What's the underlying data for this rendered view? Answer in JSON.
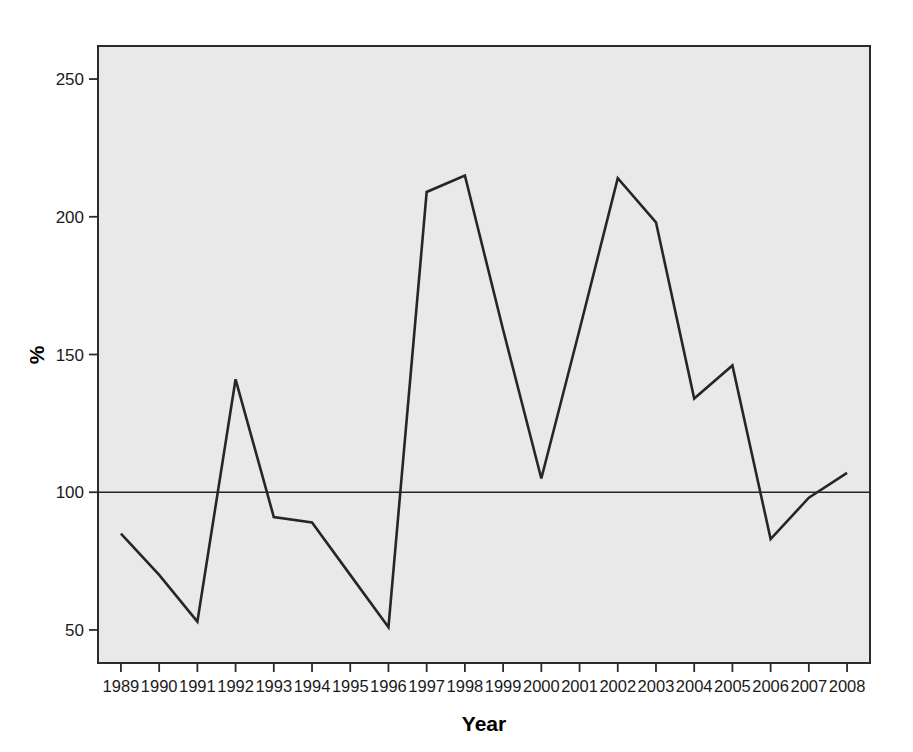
{
  "chart_data": {
    "type": "line",
    "title": "",
    "xlabel": "Year",
    "ylabel": "%",
    "x": [
      1989,
      1990,
      1991,
      1992,
      1993,
      1994,
      1995,
      1996,
      1997,
      1998,
      1999,
      2000,
      2001,
      2002,
      2003,
      2004,
      2005,
      2006,
      2007,
      2008
    ],
    "categories": [
      "1989",
      "1990",
      "1991",
      "1992",
      "1993",
      "1994",
      "1995",
      "1996",
      "1997",
      "1998",
      "1999",
      "2000",
      "2001",
      "2002",
      "2003",
      "2004",
      "2005",
      "2006",
      "2007",
      "2008"
    ],
    "values": [
      85,
      70,
      53,
      141,
      91,
      89,
      70,
      51,
      209,
      215,
      159,
      105,
      159,
      214,
      198,
      134,
      146,
      83,
      98,
      107
    ],
    "series": [
      {
        "name": "%",
        "values": [
          85,
          70,
          53,
          141,
          91,
          89,
          70,
          51,
          209,
          215,
          159,
          105,
          159,
          214,
          198,
          134,
          146,
          83,
          98,
          107
        ]
      }
    ],
    "xlim": [
      1988.4,
      2008.6
    ],
    "ylim": [
      38,
      262
    ],
    "yticks": [
      50,
      100,
      150,
      200,
      250
    ],
    "ytick_labels": [
      "50",
      "100",
      "150",
      "200",
      "250"
    ],
    "xticks": [
      1989,
      1990,
      1991,
      1992,
      1993,
      1994,
      1995,
      1996,
      1997,
      1998,
      1999,
      2000,
      2001,
      2002,
      2003,
      2004,
      2005,
      2006,
      2007,
      2008
    ],
    "grid": false,
    "legend": "none",
    "reference_lines": [
      {
        "orientation": "horizontal",
        "value": 100,
        "label": ""
      }
    ],
    "colors": {
      "line": "#262626",
      "plot_background": "#e9e9e9",
      "page_background": "#ffffff",
      "axis": "#2b2b2b",
      "text": "#1a1a1a"
    }
  }
}
